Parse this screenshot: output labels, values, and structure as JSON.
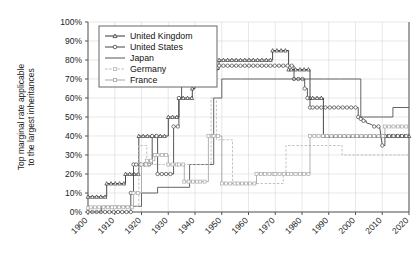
{
  "chart_data": {
    "type": "line",
    "title": "",
    "xlabel": "",
    "ylabel": "Top marginal rate applicable to the largest inheritances",
    "xlim": [
      1900,
      2020
    ],
    "ylim": [
      0,
      1.0
    ],
    "grid": true,
    "legend_position": "top-left",
    "x_ticks": [
      "1900",
      "1910",
      "1920",
      "1930",
      "1940",
      "1950",
      "1960",
      "1970",
      "1980",
      "1990",
      "2000",
      "2010",
      "2020"
    ],
    "y_ticks": [
      "0%",
      "10%",
      "20%",
      "30%",
      "40%",
      "50%",
      "60%",
      "70%",
      "80%",
      "90%",
      "100%"
    ],
    "series": [
      {
        "name": "United Kingdom",
        "marker": "triangle",
        "color": "#333333",
        "points": [
          [
            1900,
            0.08
          ],
          [
            1907,
            0.08
          ],
          [
            1907,
            0.15
          ],
          [
            1914,
            0.15
          ],
          [
            1914,
            0.2
          ],
          [
            1919,
            0.2
          ],
          [
            1919,
            0.4
          ],
          [
            1930,
            0.4
          ],
          [
            1930,
            0.5
          ],
          [
            1934,
            0.5
          ],
          [
            1934,
            0.6
          ],
          [
            1939,
            0.6
          ],
          [
            1939,
            0.65
          ],
          [
            1940,
            0.65
          ],
          [
            1940,
            0.8
          ],
          [
            1946,
            0.8
          ],
          [
            1946,
            0.75
          ],
          [
            1949,
            0.75
          ],
          [
            1949,
            0.8
          ],
          [
            1969,
            0.8
          ],
          [
            1969,
            0.85
          ],
          [
            1975,
            0.85
          ],
          [
            1975,
            0.75
          ],
          [
            1976,
            0.75
          ],
          [
            1976,
            0.75
          ],
          [
            1983,
            0.75
          ],
          [
            1983,
            0.6
          ],
          [
            1984,
            0.6
          ],
          [
            1984,
            0.6
          ],
          [
            1988,
            0.6
          ],
          [
            1988,
            0.4
          ],
          [
            2020,
            0.4
          ]
        ]
      },
      {
        "name": "United States",
        "marker": "circle",
        "color": "#444444",
        "points": [
          [
            1900,
            0.0
          ],
          [
            1916,
            0.0
          ],
          [
            1916,
            0.1
          ],
          [
            1917,
            0.1
          ],
          [
            1917,
            0.25
          ],
          [
            1918,
            0.25
          ],
          [
            1918,
            0.25
          ],
          [
            1924,
            0.25
          ],
          [
            1924,
            0.4
          ],
          [
            1926,
            0.4
          ],
          [
            1926,
            0.2
          ],
          [
            1932,
            0.2
          ],
          [
            1932,
            0.45
          ],
          [
            1934,
            0.45
          ],
          [
            1934,
            0.6
          ],
          [
            1935,
            0.6
          ],
          [
            1935,
            0.7
          ],
          [
            1940,
            0.7
          ],
          [
            1940,
            0.7
          ],
          [
            1941,
            0.7
          ],
          [
            1941,
            0.77
          ],
          [
            1977,
            0.77
          ],
          [
            1977,
            0.7
          ],
          [
            1981,
            0.7
          ],
          [
            1981,
            0.65
          ],
          [
            1982,
            0.65
          ],
          [
            1982,
            0.6
          ],
          [
            1983,
            0.6
          ],
          [
            1983,
            0.55
          ],
          [
            1984,
            0.55
          ],
          [
            1984,
            0.55
          ],
          [
            2001,
            0.55
          ],
          [
            2001,
            0.5
          ],
          [
            2002,
            0.5
          ],
          [
            2002,
            0.49
          ],
          [
            2003,
            0.49
          ],
          [
            2003,
            0.48
          ],
          [
            2004,
            0.48
          ],
          [
            2004,
            0.47
          ],
          [
            2006,
            0.46
          ],
          [
            2007,
            0.45
          ],
          [
            2009,
            0.45
          ],
          [
            2009,
            0.45
          ],
          [
            2010,
            0.35
          ],
          [
            2011,
            0.35
          ],
          [
            2011,
            0.4
          ],
          [
            2020,
            0.4
          ]
        ]
      },
      {
        "name": "Japan",
        "marker": "none",
        "color": "#555555",
        "points": [
          [
            1900,
            0.0
          ],
          [
            1905,
            0.0
          ],
          [
            1905,
            0.03
          ],
          [
            1920,
            0.03
          ],
          [
            1920,
            0.1
          ],
          [
            1926,
            0.1
          ],
          [
            1926,
            0.13
          ],
          [
            1938,
            0.13
          ],
          [
            1938,
            0.25
          ],
          [
            1947,
            0.25
          ],
          [
            1947,
            0.6
          ],
          [
            1949,
            0.6
          ],
          [
            1949,
            0.6
          ],
          [
            1950,
            0.6
          ],
          [
            1950,
            0.7
          ],
          [
            1952,
            0.7
          ],
          [
            1952,
            0.7
          ],
          [
            1957,
            0.7
          ],
          [
            1957,
            0.7
          ],
          [
            1988,
            0.7
          ],
          [
            1988,
            0.7
          ],
          [
            1994,
            0.7
          ],
          [
            1994,
            0.7
          ],
          [
            2002,
            0.7
          ],
          [
            2002,
            0.5
          ],
          [
            2003,
            0.5
          ],
          [
            2003,
            0.5
          ],
          [
            2014,
            0.5
          ],
          [
            2014,
            0.55
          ],
          [
            2020,
            0.55
          ]
        ]
      },
      {
        "name": "Germany",
        "marker": "dashed",
        "color": "#bbbbbb",
        "points": [
          [
            1900,
            0.0
          ],
          [
            1906,
            0.0
          ],
          [
            1906,
            0.03
          ],
          [
            1919,
            0.03
          ],
          [
            1919,
            0.35
          ],
          [
            1920,
            0.35
          ],
          [
            1920,
            0.35
          ],
          [
            1922,
            0.35
          ],
          [
            1922,
            0.25
          ],
          [
            1925,
            0.25
          ],
          [
            1925,
            0.25
          ],
          [
            1933,
            0.25
          ],
          [
            1933,
            0.25
          ],
          [
            1946,
            0.25
          ],
          [
            1946,
            0.6
          ],
          [
            1948,
            0.6
          ],
          [
            1948,
            0.38
          ],
          [
            1949,
            0.38
          ],
          [
            1949,
            0.38
          ],
          [
            1954,
            0.38
          ],
          [
            1954,
            0.15
          ],
          [
            1959,
            0.15
          ],
          [
            1959,
            0.15
          ],
          [
            1973,
            0.15
          ],
          [
            1973,
            0.2
          ],
          [
            1974,
            0.2
          ],
          [
            1974,
            0.35
          ],
          [
            1995,
            0.35
          ],
          [
            1995,
            0.3
          ],
          [
            2008,
            0.3
          ],
          [
            2008,
            0.3
          ],
          [
            2020,
            0.3
          ]
        ]
      },
      {
        "name": "France",
        "marker": "square",
        "color": "#a8a8a8",
        "points": [
          [
            1900,
            0.02
          ],
          [
            1901,
            0.02
          ],
          [
            1901,
            0.025
          ],
          [
            1910,
            0.025
          ],
          [
            1910,
            0.025
          ],
          [
            1917,
            0.025
          ],
          [
            1917,
            0.1
          ],
          [
            1920,
            0.1
          ],
          [
            1920,
            0.25
          ],
          [
            1922,
            0.25
          ],
          [
            1922,
            0.27
          ],
          [
            1925,
            0.27
          ],
          [
            1925,
            0.3
          ],
          [
            1926,
            0.3
          ],
          [
            1926,
            0.3
          ],
          [
            1930,
            0.3
          ],
          [
            1930,
            0.25
          ],
          [
            1934,
            0.25
          ],
          [
            1934,
            0.25
          ],
          [
            1936,
            0.25
          ],
          [
            1936,
            0.16
          ],
          [
            1942,
            0.16
          ],
          [
            1942,
            0.16
          ],
          [
            1945,
            0.16
          ],
          [
            1945,
            0.4
          ],
          [
            1947,
            0.4
          ],
          [
            1947,
            0.4
          ],
          [
            1950,
            0.4
          ],
          [
            1950,
            0.15
          ],
          [
            1956,
            0.15
          ],
          [
            1956,
            0.15
          ],
          [
            1959,
            0.15
          ],
          [
            1959,
            0.15
          ],
          [
            1963,
            0.15
          ],
          [
            1963,
            0.2
          ],
          [
            1970,
            0.2
          ],
          [
            1970,
            0.2
          ],
          [
            1976,
            0.2
          ],
          [
            1976,
            0.2
          ],
          [
            1983,
            0.2
          ],
          [
            1983,
            0.4
          ],
          [
            2011,
            0.4
          ],
          [
            2011,
            0.45
          ],
          [
            2020,
            0.45
          ]
        ]
      }
    ]
  },
  "legend": {
    "items": [
      {
        "label": "United Kingdom"
      },
      {
        "label": "United States"
      },
      {
        "label": "Japan"
      },
      {
        "label": "Germany"
      },
      {
        "label": "France"
      }
    ]
  }
}
